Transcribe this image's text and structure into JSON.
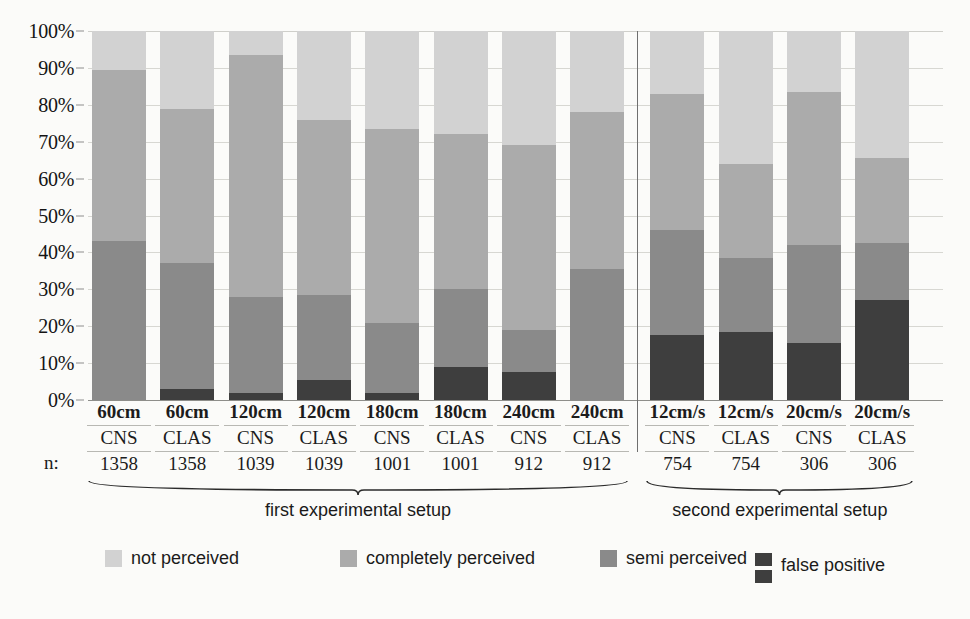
{
  "chart_data": {
    "type": "bar",
    "subtype": "stacked-percentage",
    "title": "",
    "xlabel": "",
    "ylabel": "",
    "ylim": [
      0,
      100
    ],
    "ytick_labels": [
      "0%",
      "10%",
      "20%",
      "30%",
      "40%",
      "50%",
      "60%",
      "70%",
      "80%",
      "90%",
      "100%"
    ],
    "ytick_values": [
      0,
      10,
      20,
      30,
      40,
      50,
      60,
      70,
      80,
      90,
      100
    ],
    "grid": true,
    "legend_position": "bottom",
    "stack_order_bottom_to_top": [
      "false positive",
      "semi perceived",
      "completely perceived",
      "not perceived"
    ],
    "categories": [
      "60cm CNS",
      "60cm CLAS",
      "120cm CNS",
      "120cm CLAS",
      "180cm CNS",
      "180cm CLAS",
      "240cm CNS",
      "240cm CLAS",
      "12cm/s CNS",
      "12cm/s CLAS",
      "20cm/s CNS",
      "20cm/s CLAS"
    ],
    "series": [
      {
        "name": "false positive",
        "color": "#3e3e3e",
        "values": [
          0.0,
          3.0,
          2.0,
          5.5,
          2.0,
          9.0,
          7.5,
          0.0,
          17.5,
          18.5,
          15.5,
          27.0
        ]
      },
      {
        "name": "semi perceived",
        "color": "#8a8a8a",
        "values": [
          43.0,
          34.0,
          26.0,
          23.0,
          19.0,
          21.0,
          11.5,
          35.5,
          28.5,
          20.0,
          26.5,
          15.5
        ]
      },
      {
        "name": "completely perceived",
        "color": "#ababab",
        "values": [
          46.5,
          42.0,
          65.5,
          47.5,
          52.5,
          42.0,
          50.0,
          42.5,
          37.0,
          25.5,
          41.5,
          23.0
        ]
      },
      {
        "name": "not perceived",
        "color": "#d2d2d2",
        "values": [
          10.5,
          21.0,
          6.5,
          24.0,
          26.5,
          28.0,
          31.0,
          22.0,
          17.0,
          36.0,
          16.5,
          34.5
        ]
      }
    ],
    "cumulative_tops": {
      "false positive": [
        0.0,
        3.0,
        2.0,
        5.5,
        2.0,
        9.0,
        7.5,
        0.0,
        17.5,
        18.5,
        15.5,
        27.0
      ],
      "semi perceived": [
        43.0,
        37.0,
        28.0,
        28.5,
        21.0,
        30.0,
        19.0,
        35.5,
        46.0,
        38.5,
        42.0,
        42.5
      ],
      "completely perceived": [
        89.5,
        79.0,
        93.5,
        76.0,
        73.5,
        72.0,
        69.0,
        78.0,
        83.0,
        64.0,
        83.5,
        65.5
      ],
      "not perceived": [
        100,
        100,
        100,
        100,
        100,
        100,
        100,
        100,
        100,
        100,
        100,
        100
      ]
    }
  },
  "xaxis": {
    "n_prefix": "n:",
    "columns": [
      {
        "condition": "60cm",
        "method": "CNS",
        "n": "1358"
      },
      {
        "condition": "60cm",
        "method": "CLAS",
        "n": "1358"
      },
      {
        "condition": "120cm",
        "method": "CNS",
        "n": "1039"
      },
      {
        "condition": "120cm",
        "method": "CLAS",
        "n": "1039"
      },
      {
        "condition": "180cm",
        "method": "CNS",
        "n": "1001"
      },
      {
        "condition": "180cm",
        "method": "CLAS",
        "n": "1001"
      },
      {
        "condition": "240cm",
        "method": "CNS",
        "n": "912"
      },
      {
        "condition": "240cm",
        "method": "CLAS",
        "n": "912"
      },
      {
        "condition": "12cm/s",
        "method": "CNS",
        "n": "754"
      },
      {
        "condition": "12cm/s",
        "method": "CLAS",
        "n": "754"
      },
      {
        "condition": "20cm/s",
        "method": "CNS",
        "n": "306"
      },
      {
        "condition": "20cm/s",
        "method": "CLAS",
        "n": "306"
      }
    ]
  },
  "groups": [
    {
      "label": "first experimental setup",
      "start_index": 0,
      "end_index": 7
    },
    {
      "label": "second experimental setup",
      "start_index": 8,
      "end_index": 11
    }
  ],
  "legend": {
    "items": [
      {
        "label": "not perceived",
        "color": "#d2d2d2"
      },
      {
        "label": "completely perceived",
        "color": "#ababab"
      },
      {
        "label": "semi perceived",
        "color": "#8a8a8a"
      },
      {
        "label": "false positive",
        "color": "#3e3e3e"
      }
    ]
  },
  "colors": {
    "background": "#fbfbf9",
    "grid": "#d7d7d2",
    "axis": "#8e8e8a",
    "text": "#1c1c1c"
  }
}
